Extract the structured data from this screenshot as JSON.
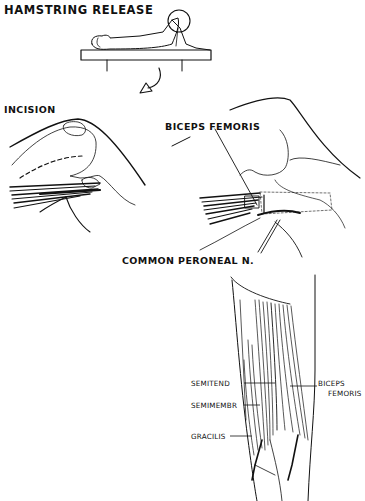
{
  "title": "HAMSTRING RELEASE",
  "panels": {
    "overview": {
      "description": "Patient supine on operating table with knee flexed, circle highlighting knee"
    },
    "incision": {
      "label": "INCISION"
    },
    "biceps_view": {
      "labels": [
        "BICEPS FEMORIS",
        "COMMON PERONEAL N."
      ]
    },
    "posterior_view": {
      "labels": {
        "semitend": "SEMITEND",
        "semimembr": "SEMIMEMBR",
        "gracilis": "GRACILIS",
        "biceps_line1": "BICEPS",
        "biceps_line2": "FEMORIS"
      }
    }
  }
}
